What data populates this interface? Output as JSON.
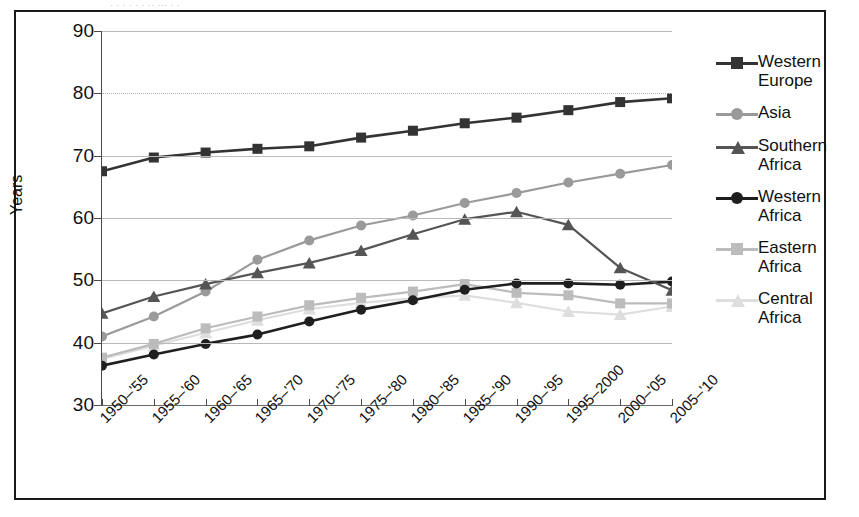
{
  "title_ink": "· · · ·   · ·  ·· ···  ·  ·",
  "axes": {
    "y_title": "Years",
    "y_ticks": [
      90,
      80,
      70,
      60,
      50,
      40,
      30
    ],
    "y_min": 30,
    "y_max": 90
  },
  "legend": {
    "items": [
      {
        "label_line1": "Western",
        "label_line2": "Europe",
        "color": "#333333",
        "symbol": "square"
      },
      {
        "label_line1": "Asia",
        "label_line2": "",
        "color": "#9a9a9a",
        "symbol": "circle"
      },
      {
        "label_line1": "Southern",
        "label_line2": "Africa",
        "color": "#555555",
        "symbol": "triangle"
      },
      {
        "label_line1": "Western",
        "label_line2": "Africa",
        "color": "#1f1f1f",
        "symbol": "circle"
      },
      {
        "label_line1": "Eastern",
        "label_line2": "Africa",
        "color": "#bcbcbc",
        "symbol": "square"
      },
      {
        "label_line1": "Central",
        "label_line2": "Africa",
        "color": "#dedede",
        "symbol": "triangle"
      }
    ]
  },
  "chart_data": {
    "type": "line",
    "title": "",
    "xlabel": "",
    "ylabel": "Years",
    "ylim": [
      30,
      90
    ],
    "ytick_step": 10,
    "grid": true,
    "legend_position": "right",
    "categories": [
      "1950–'55",
      "1955–'60",
      "1960–'65",
      "1965–'70",
      "1970–'75",
      "1975–'80",
      "1980–'85",
      "1985–'90",
      "1990–'95",
      "1995–2000",
      "2000–'05",
      "2005–'10"
    ],
    "series": [
      {
        "name": "Western Europe",
        "color": "#333333",
        "symbol": "square",
        "values": [
          67.5,
          69.7,
          70.5,
          71.1,
          71.5,
          72.9,
          74.0,
          75.2,
          76.1,
          77.3,
          78.6,
          79.2
        ]
      },
      {
        "name": "Asia",
        "color": "#9a9a9a",
        "symbol": "circle",
        "values": [
          41.0,
          44.2,
          48.2,
          53.3,
          56.4,
          58.8,
          60.4,
          62.4,
          64.0,
          65.7,
          67.1,
          68.5
        ]
      },
      {
        "name": "Southern Africa",
        "color": "#555555",
        "symbol": "triangle",
        "values": [
          44.7,
          47.4,
          49.4,
          51.2,
          52.8,
          54.8,
          57.4,
          59.8,
          61.0,
          58.9,
          52.0,
          48.4
        ]
      },
      {
        "name": "Western Africa",
        "color": "#1f1f1f",
        "symbol": "circle",
        "values": [
          36.3,
          38.1,
          39.8,
          41.3,
          43.4,
          45.3,
          46.8,
          48.5,
          49.5,
          49.5,
          49.3,
          49.8
        ]
      },
      {
        "name": "Eastern Africa",
        "color": "#bcbcbc",
        "symbol": "square",
        "values": [
          37.6,
          39.8,
          42.3,
          44.2,
          46.0,
          47.2,
          48.2,
          49.4,
          48.0,
          47.6,
          46.3,
          46.3
        ]
      },
      {
        "name": "Central Africa",
        "color": "#dedede",
        "symbol": "triangle",
        "values": [
          37.4,
          39.5,
          41.6,
          43.6,
          45.4,
          46.4,
          47.1,
          47.6,
          46.4,
          45.0,
          44.5,
          45.8
        ]
      }
    ]
  }
}
